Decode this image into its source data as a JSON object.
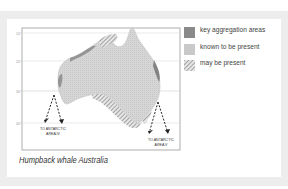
{
  "map": {
    "title": "Humpback whale Australia",
    "latitude_labels": [
      "10°",
      "20°",
      "30°",
      "40°"
    ],
    "annotations": [
      {
        "id": "area-iv",
        "line1": "TO ANTARCTIC",
        "line2": "AREA IV"
      },
      {
        "id": "area-v",
        "line1": "TO ANTARCTIC",
        "line2": "AREA V"
      }
    ],
    "colors": {
      "land": "#d3d3d3",
      "key_aggregation": "#8a8a8a",
      "known_present": "#c9c9c9",
      "may_be_present_hatch": "#7d7d7d",
      "arrow": "#222222"
    }
  },
  "legend": {
    "items": [
      {
        "label": "key aggregation areas",
        "type": "solid-dark"
      },
      {
        "label": "known to be present",
        "type": "solid-light"
      },
      {
        "label": "may be present",
        "type": "hatched"
      }
    ]
  },
  "caption": "Humpback whale Australia"
}
